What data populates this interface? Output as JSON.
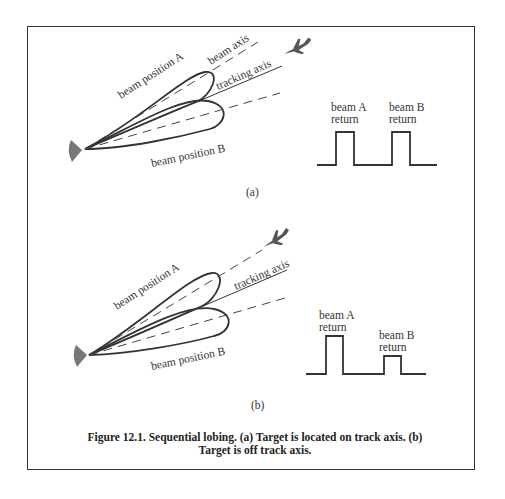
{
  "figure": {
    "caption_line1": "Figure 12.1. Sequential lobing. (a) Target is located on track axis.     (b)",
    "caption_line2": "Target is off track axis.",
    "panel_a": {
      "label": "(a)",
      "beam_a_label": "beam position A",
      "beam_b_label": "beam position B",
      "beam_axis_label": "beam axis",
      "tracking_axis_label": "tracking axis",
      "return_a_label_1": "beam A",
      "return_a_label_2": "return",
      "return_b_label_1": "beam B",
      "return_b_label_2": "return",
      "returns": {
        "beam_a_height": "equal",
        "beam_b_height": "equal"
      }
    },
    "panel_b": {
      "label": "(b)",
      "beam_a_label": "beam position A",
      "beam_b_label": "beam position B",
      "tracking_axis_label": "tracking axis",
      "return_a_label_1": "beam A",
      "return_a_label_2": "return",
      "return_b_label_1": "beam B",
      "return_b_label_2": "return",
      "returns": {
        "beam_a_height": "large",
        "beam_b_height": "small"
      }
    }
  },
  "icons": {
    "antenna": "radar-dish-icon",
    "target": "aircraft-icon"
  }
}
